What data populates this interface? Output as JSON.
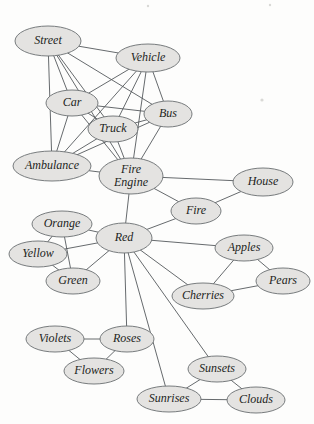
{
  "diagram": {
    "type": "semantic-network",
    "title": "",
    "node_style": {
      "fill": "#e4e3e1",
      "stroke": "#6a6e71",
      "label_color": "#1d1f21"
    },
    "edge_style": {
      "stroke": "#55595c"
    },
    "nodes": [
      {
        "id": "street",
        "label": "Street",
        "cx": 48,
        "cy": 41,
        "rx": 33,
        "ry": 15,
        "font_size": 12
      },
      {
        "id": "vehicle",
        "label": "Vehicle",
        "cx": 148,
        "cy": 58,
        "rx": 32,
        "ry": 14,
        "font_size": 12
      },
      {
        "id": "car",
        "label": "Car",
        "cx": 72,
        "cy": 103,
        "rx": 26,
        "ry": 13,
        "font_size": 12
      },
      {
        "id": "bus",
        "label": "Bus",
        "cx": 168,
        "cy": 114,
        "rx": 24,
        "ry": 13,
        "font_size": 12
      },
      {
        "id": "truck",
        "label": "Truck",
        "cx": 113,
        "cy": 129,
        "rx": 25,
        "ry": 13,
        "font_size": 12
      },
      {
        "id": "ambulance",
        "label": "Ambulance",
        "cx": 52,
        "cy": 166,
        "rx": 39,
        "ry": 15,
        "font_size": 12
      },
      {
        "id": "fire_engine",
        "label": "Fire Engine",
        "cx": 131,
        "cy": 176,
        "rx": 32,
        "ry": 18,
        "font_size": 12,
        "two_line": true,
        "line1": "Fire",
        "line2": "Engine"
      },
      {
        "id": "house",
        "label": "House",
        "cx": 263,
        "cy": 182,
        "rx": 30,
        "ry": 14,
        "font_size": 12
      },
      {
        "id": "fire",
        "label": "Fire",
        "cx": 196,
        "cy": 211,
        "rx": 25,
        "ry": 13,
        "font_size": 12
      },
      {
        "id": "orange",
        "label": "Orange",
        "cx": 62,
        "cy": 224,
        "rx": 30,
        "ry": 13,
        "font_size": 12
      },
      {
        "id": "red",
        "label": "Red",
        "cx": 124,
        "cy": 238,
        "rx": 28,
        "ry": 15,
        "font_size": 12
      },
      {
        "id": "apples",
        "label": "Apples",
        "cx": 244,
        "cy": 248,
        "rx": 29,
        "ry": 13,
        "font_size": 12
      },
      {
        "id": "yellow",
        "label": "Yellow",
        "cx": 38,
        "cy": 254,
        "rx": 29,
        "ry": 13,
        "font_size": 12
      },
      {
        "id": "pears",
        "label": "Pears",
        "cx": 283,
        "cy": 281,
        "rx": 27,
        "ry": 13,
        "font_size": 12
      },
      {
        "id": "green",
        "label": "Green",
        "cx": 73,
        "cy": 281,
        "rx": 27,
        "ry": 13,
        "font_size": 12
      },
      {
        "id": "cherries",
        "label": "Cherries",
        "cx": 203,
        "cy": 296,
        "rx": 31,
        "ry": 13,
        "font_size": 12
      },
      {
        "id": "violets",
        "label": "Violets",
        "cx": 55,
        "cy": 339,
        "rx": 29,
        "ry": 13,
        "font_size": 12
      },
      {
        "id": "roses",
        "label": "Roses",
        "cx": 127,
        "cy": 339,
        "rx": 27,
        "ry": 13,
        "font_size": 12
      },
      {
        "id": "sunsets",
        "label": "Sunsets",
        "cx": 217,
        "cy": 369,
        "rx": 29,
        "ry": 13,
        "font_size": 12
      },
      {
        "id": "flowers",
        "label": "Flowers",
        "cx": 94,
        "cy": 371,
        "rx": 30,
        "ry": 13,
        "font_size": 12
      },
      {
        "id": "sunrises",
        "label": "Sunrises",
        "cx": 169,
        "cy": 399,
        "rx": 32,
        "ry": 13,
        "font_size": 12
      },
      {
        "id": "clouds",
        "label": "Clouds",
        "cx": 256,
        "cy": 400,
        "rx": 29,
        "ry": 13,
        "font_size": 12
      }
    ],
    "edges": [
      {
        "source": "street",
        "target": "vehicle"
      },
      {
        "source": "street",
        "target": "car"
      },
      {
        "source": "street",
        "target": "bus"
      },
      {
        "source": "street",
        "target": "truck"
      },
      {
        "source": "street",
        "target": "ambulance"
      },
      {
        "source": "street",
        "target": "fire_engine"
      },
      {
        "source": "vehicle",
        "target": "car"
      },
      {
        "source": "vehicle",
        "target": "bus"
      },
      {
        "source": "vehicle",
        "target": "truck"
      },
      {
        "source": "vehicle",
        "target": "ambulance"
      },
      {
        "source": "vehicle",
        "target": "fire_engine"
      },
      {
        "source": "car",
        "target": "bus"
      },
      {
        "source": "car",
        "target": "truck"
      },
      {
        "source": "car",
        "target": "ambulance"
      },
      {
        "source": "car",
        "target": "fire_engine"
      },
      {
        "source": "bus",
        "target": "truck"
      },
      {
        "source": "bus",
        "target": "ambulance"
      },
      {
        "source": "bus",
        "target": "fire_engine"
      },
      {
        "source": "truck",
        "target": "ambulance"
      },
      {
        "source": "truck",
        "target": "fire_engine"
      },
      {
        "source": "ambulance",
        "target": "fire_engine"
      },
      {
        "source": "fire_engine",
        "target": "house"
      },
      {
        "source": "fire_engine",
        "target": "fire"
      },
      {
        "source": "fire_engine",
        "target": "red"
      },
      {
        "source": "house",
        "target": "fire"
      },
      {
        "source": "fire",
        "target": "red"
      },
      {
        "source": "red",
        "target": "orange"
      },
      {
        "source": "red",
        "target": "yellow"
      },
      {
        "source": "red",
        "target": "green"
      },
      {
        "source": "red",
        "target": "apples"
      },
      {
        "source": "red",
        "target": "cherries"
      },
      {
        "source": "red",
        "target": "roses"
      },
      {
        "source": "red",
        "target": "sunsets"
      },
      {
        "source": "red",
        "target": "sunrises"
      },
      {
        "source": "orange",
        "target": "yellow"
      },
      {
        "source": "orange",
        "target": "green"
      },
      {
        "source": "yellow",
        "target": "green"
      },
      {
        "source": "apples",
        "target": "pears"
      },
      {
        "source": "apples",
        "target": "cherries"
      },
      {
        "source": "pears",
        "target": "cherries"
      },
      {
        "source": "violets",
        "target": "roses"
      },
      {
        "source": "violets",
        "target": "flowers"
      },
      {
        "source": "roses",
        "target": "flowers"
      },
      {
        "source": "sunsets",
        "target": "sunrises"
      },
      {
        "source": "sunsets",
        "target": "clouds"
      },
      {
        "source": "sunrises",
        "target": "clouds"
      }
    ]
  }
}
